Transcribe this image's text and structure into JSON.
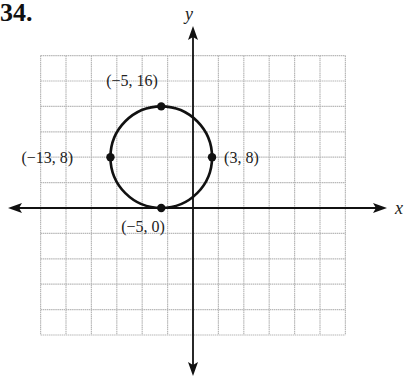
{
  "problem_number": "34.",
  "chart_data": {
    "type": "scatter",
    "title": "",
    "xlabel": "x",
    "ylabel": "y",
    "circle": {
      "center": [
        -5,
        8
      ],
      "radius": 8
    },
    "points": [
      {
        "x": -5,
        "y": 16,
        "label": "(−5, 16)"
      },
      {
        "x": -13,
        "y": 8,
        "label": "(−13, 8)"
      },
      {
        "x": 3,
        "y": 8,
        "label": "(3, 8)"
      },
      {
        "x": -5,
        "y": 0,
        "label": "(−5, 0)"
      }
    ],
    "grid": true,
    "grid_spacing": 4,
    "xlim": [
      -24,
      24
    ],
    "ylim": [
      -20,
      24
    ],
    "legend": null
  },
  "colors": {
    "grid": "#b8b8b8",
    "axis": "#111111",
    "curve": "#111111"
  }
}
